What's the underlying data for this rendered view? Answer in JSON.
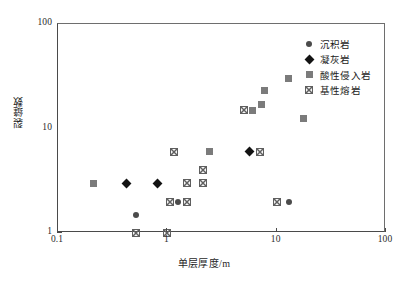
{
  "chart_data": {
    "type": "scatter",
    "title": "",
    "xlabel": "单层厚度/m",
    "ylabel": "裂缝数",
    "xscale": "log",
    "yscale": "log",
    "xlim": [
      0.1,
      100
    ],
    "ylim": [
      1,
      100
    ],
    "xticks": [
      "0.1",
      "1",
      "10",
      "100"
    ],
    "xtick_values": [
      0.1,
      1,
      10,
      100
    ],
    "yticks": [
      "1",
      "10",
      "100"
    ],
    "ytick_values": [
      1,
      10,
      100
    ],
    "grid": false,
    "legend_position": "top-right",
    "series": [
      {
        "name": "沉积岩",
        "marker": "circle",
        "color": "#4b4b4b",
        "points": [
          {
            "x": 0.52,
            "y": 1.5
          },
          {
            "x": 1.25,
            "y": 2.0
          },
          {
            "x": 13.0,
            "y": 2.0
          }
        ]
      },
      {
        "name": "凝灰岩",
        "marker": "diamond",
        "color": "#131313",
        "points": [
          {
            "x": 0.42,
            "y": 3.0
          },
          {
            "x": 0.82,
            "y": 3.0
          },
          {
            "x": 5.6,
            "y": 6.0
          }
        ]
      },
      {
        "name": "酸性侵入岩",
        "marker": "square",
        "color": "#7b7b7b",
        "points": [
          {
            "x": 0.21,
            "y": 3.0
          },
          {
            "x": 2.45,
            "y": 6.0
          },
          {
            "x": 6.0,
            "y": 15.0
          },
          {
            "x": 7.3,
            "y": 17.0
          },
          {
            "x": 7.8,
            "y": 23.0
          },
          {
            "x": 12.8,
            "y": 30.0
          },
          {
            "x": 17.5,
            "y": 12.5
          }
        ]
      },
      {
        "name": "基性熔岩",
        "marker": "x-in-square",
        "color": "#5f5f5f",
        "points": [
          {
            "x": 0.52,
            "y": 1.0
          },
          {
            "x": 1.0,
            "y": 1.0
          },
          {
            "x": 1.05,
            "y": 2.0
          },
          {
            "x": 1.5,
            "y": 2.0
          },
          {
            "x": 1.15,
            "y": 6.0
          },
          {
            "x": 1.5,
            "y": 3.0
          },
          {
            "x": 2.1,
            "y": 3.0
          },
          {
            "x": 2.1,
            "y": 4.0
          },
          {
            "x": 5.0,
            "y": 15.0
          },
          {
            "x": 7.0,
            "y": 6.0
          },
          {
            "x": 10.0,
            "y": 2.0
          }
        ]
      }
    ]
  },
  "legend": {
    "items": [
      {
        "label": "沉积岩",
        "marker": "circle"
      },
      {
        "label": "凝灰岩",
        "marker": "diamond"
      },
      {
        "label": "酸性侵入岩",
        "marker": "square"
      },
      {
        "label": "基性熔岩",
        "marker": "x-in-square"
      }
    ]
  },
  "axes": {
    "x_title": "单层厚度/m",
    "y_title": "裂缝数"
  }
}
